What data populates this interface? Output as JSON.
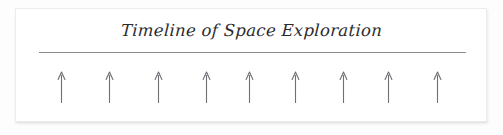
{
  "page": {
    "background_color": "#fdfdfd",
    "card_background_color": "#ffffff",
    "card_border_color": "#ececed"
  },
  "slide": {
    "title": "Timeline of Space Exploration",
    "title_color": "#2b2b2e",
    "divider": {
      "name": "title-underline",
      "color": "#8a8a90"
    }
  },
  "timeline": {
    "name": "timeline-arrow-row",
    "arrow_color": "#6f6f76",
    "arrow_count": 9,
    "arrow_icon": "arrow-up-icon",
    "arrows": [
      {
        "index": 1,
        "x_percent": 9.7,
        "label": ""
      },
      {
        "index": 2,
        "x_percent": 19.9,
        "label": ""
      },
      {
        "index": 3,
        "x_percent": 30.1,
        "label": ""
      },
      {
        "index": 4,
        "x_percent": 40.3,
        "label": ""
      },
      {
        "index": 5,
        "x_percent": 49.4,
        "label": ""
      },
      {
        "index": 6,
        "x_percent": 59.3,
        "label": ""
      },
      {
        "index": 7,
        "x_percent": 69.3,
        "label": ""
      },
      {
        "index": 8,
        "x_percent": 79.0,
        "label": ""
      },
      {
        "index": 9,
        "x_percent": 89.2,
        "label": ""
      }
    ]
  }
}
